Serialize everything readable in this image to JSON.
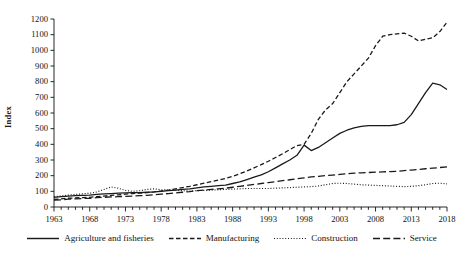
{
  "chart_data": {
    "type": "line",
    "title": "",
    "xlabel": "",
    "ylabel": "Index",
    "xlim": [
      1963,
      2018
    ],
    "ylim": [
      0,
      1200
    ],
    "ytick_step": 100,
    "xtick_step": 5,
    "grid": false,
    "legend_position": "bottom",
    "yticks": [
      "0",
      "100",
      "200",
      "300",
      "400",
      "500",
      "600",
      "700",
      "800",
      "900",
      "1000",
      "1100",
      "1200"
    ],
    "xticks": [
      "1963",
      "1968",
      "1973",
      "1978",
      "1983",
      "1988",
      "1993",
      "1998",
      "2003",
      "2008",
      "2013",
      "2018"
    ],
    "x": [
      1963,
      1964,
      1965,
      1966,
      1967,
      1968,
      1969,
      1970,
      1971,
      1972,
      1973,
      1974,
      1975,
      1976,
      1977,
      1978,
      1979,
      1980,
      1981,
      1982,
      1983,
      1984,
      1985,
      1986,
      1987,
      1988,
      1989,
      1990,
      1991,
      1992,
      1993,
      1994,
      1995,
      1996,
      1997,
      1998,
      1999,
      2000,
      2001,
      2002,
      2003,
      2004,
      2005,
      2006,
      2007,
      2008,
      2009,
      2010,
      2011,
      2012,
      2013,
      2014,
      2015,
      2016,
      2017,
      2018
    ],
    "series": [
      {
        "name": "Agriculture and fisheries",
        "style": "solid",
        "color": "#1a1a1a",
        "values": [
          62,
          66,
          70,
          72,
          74,
          76,
          80,
          84,
          86,
          88,
          90,
          92,
          92,
          94,
          96,
          100,
          104,
          108,
          112,
          116,
          122,
          128,
          132,
          136,
          140,
          150,
          160,
          175,
          190,
          205,
          225,
          250,
          275,
          300,
          330,
          395,
          360,
          380,
          410,
          440,
          470,
          490,
          505,
          515,
          520,
          520,
          520,
          520,
          525,
          540,
          590,
          660,
          730,
          790,
          780,
          750
        ]
      },
      {
        "name": "Manufacturing",
        "style": "dash-dot",
        "color": "#1a1a1a",
        "values": [
          48,
          52,
          56,
          58,
          60,
          62,
          66,
          70,
          74,
          78,
          82,
          86,
          88,
          92,
          96,
          102,
          108,
          116,
          124,
          132,
          142,
          152,
          162,
          172,
          182,
          196,
          212,
          230,
          250,
          270,
          292,
          316,
          340,
          366,
          392,
          400,
          470,
          560,
          620,
          660,
          730,
          800,
          850,
          900,
          950,
          1030,
          1090,
          1100,
          1105,
          1110,
          1090,
          1060,
          1070,
          1080,
          1120,
          1180
        ]
      },
      {
        "name": "Construction",
        "style": "dotted",
        "color": "#1a1a1a",
        "values": [
          66,
          70,
          76,
          80,
          84,
          88,
          96,
          112,
          128,
          120,
          106,
          100,
          104,
          112,
          116,
          110,
          108,
          106,
          104,
          102,
          104,
          106,
          108,
          110,
          112,
          114,
          116,
          118,
          118,
          118,
          118,
          120,
          122,
          124,
          126,
          128,
          130,
          134,
          142,
          150,
          152,
          150,
          146,
          142,
          140,
          138,
          136,
          134,
          132,
          130,
          132,
          136,
          142,
          150,
          152,
          148
        ]
      },
      {
        "name": "Service",
        "style": "dashed",
        "color": "#1a1a1a",
        "values": [
          44,
          46,
          50,
          52,
          54,
          56,
          60,
          62,
          64,
          66,
          68,
          70,
          72,
          74,
          78,
          82,
          86,
          90,
          94,
          98,
          104,
          108,
          112,
          116,
          120,
          126,
          132,
          138,
          144,
          150,
          156,
          162,
          168,
          174,
          180,
          186,
          192,
          196,
          200,
          204,
          208,
          212,
          216,
          218,
          220,
          222,
          224,
          226,
          228,
          232,
          236,
          240,
          244,
          248,
          252,
          256
        ]
      }
    ]
  }
}
